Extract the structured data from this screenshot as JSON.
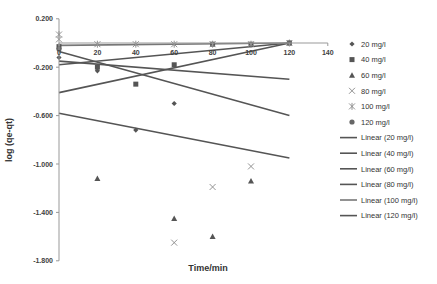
{
  "chart_data": {
    "type": "scatter",
    "title": "",
    "xlabel": "Time/min",
    "ylabel": "log (qe-qt)",
    "xlim": [
      0,
      140
    ],
    "ylim": [
      -1.8,
      0.2
    ],
    "x_ticks": [
      "0",
      "20",
      "40",
      "60",
      "80",
      "100",
      "120",
      "140"
    ],
    "y_ticks": [
      "0.200",
      "-0.200",
      "-0.600",
      "-1.000",
      "-1.400",
      "-1.800"
    ],
    "grid": false,
    "legend_position": "right",
    "series": [
      {
        "name": "20 mg/l",
        "marker": "diamond",
        "color": "#555555",
        "x": [
          0,
          20,
          40,
          60
        ],
        "y": [
          -0.12,
          -0.23,
          -0.72,
          -0.5
        ]
      },
      {
        "name": "40 mg/l",
        "marker": "square",
        "color": "#555555",
        "x": [
          0,
          20,
          40,
          60,
          80,
          100,
          120
        ],
        "y": [
          -0.03,
          -0.2,
          -0.34,
          -0.18,
          -0.01,
          -0.01,
          0.0
        ]
      },
      {
        "name": "60 mg/l",
        "marker": "triangle",
        "color": "#555555",
        "x": [
          20,
          60,
          80,
          100
        ],
        "y": [
          -1.12,
          -1.45,
          -1.6,
          -1.14
        ]
      },
      {
        "name": "80 mg/l",
        "marker": "x",
        "color": "#888888",
        "x": [
          0,
          60,
          80,
          100
        ],
        "y": [
          0.03,
          -1.65,
          -1.19,
          -1.02
        ]
      },
      {
        "name": "100 mg/l",
        "marker": "star",
        "color": "#888888",
        "x": [
          0,
          20,
          40,
          60,
          80,
          100,
          120
        ],
        "y": [
          0.07,
          -0.01,
          -0.01,
          -0.01,
          -0.01,
          -0.01,
          0.0
        ]
      },
      {
        "name": "120 mg/l",
        "marker": "circle",
        "color": "#666666",
        "x": [
          0,
          120
        ],
        "y": [
          -0.05,
          0.0
        ]
      }
    ],
    "trendlines": [
      {
        "name": "Linear (20 mg/l)",
        "x": [
          0,
          120
        ],
        "y": [
          -0.58,
          -0.95
        ],
        "color": "#555555"
      },
      {
        "name": "Linear (40 mg/l)",
        "x": [
          0,
          120
        ],
        "y": [
          -0.18,
          0.0
        ],
        "color": "#555555"
      },
      {
        "name": "Linear (60 mg/l)",
        "x": [
          0,
          120
        ],
        "y": [
          -0.41,
          0.0
        ],
        "color": "#555555"
      },
      {
        "name": "Linear (80 mg/l)",
        "x": [
          0,
          120
        ],
        "y": [
          -0.07,
          -0.6
        ],
        "color": "#555555"
      },
      {
        "name": "Linear (100 mg/l)",
        "x": [
          0,
          120
        ],
        "y": [
          -0.02,
          0.0
        ],
        "color": "#777777"
      },
      {
        "name": "Linear (120 mg/l)",
        "x": [
          0,
          120
        ],
        "y": [
          -0.15,
          -0.3
        ],
        "color": "#555555"
      }
    ]
  },
  "legend": {
    "items": [
      "20 mg/l",
      "40 mg/l",
      "60 mg/l",
      "80 mg/l",
      "100 mg/l",
      "120 mg/l",
      "Linear (20 mg/l)",
      "Linear (40 mg/l)",
      "Linear (60 mg/l)",
      "Linear (80 mg/l)",
      "Linear (100 mg/l)",
      "Linear (120 mg/l)"
    ]
  }
}
